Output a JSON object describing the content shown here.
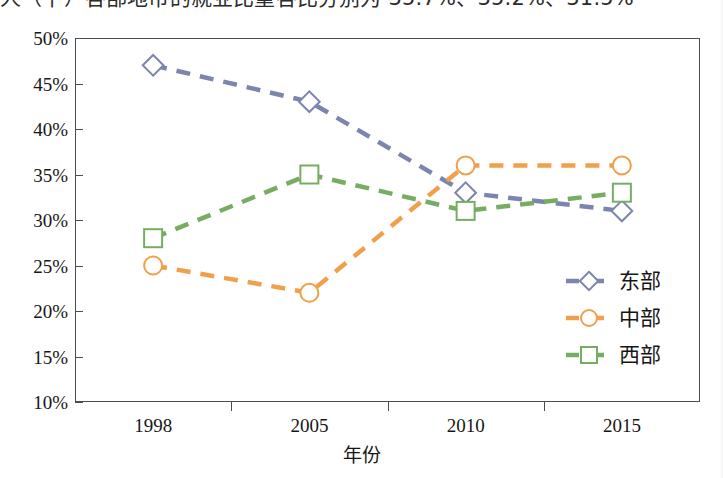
{
  "page": {
    "clipped_title": "人（下）各部地市的就业比重各比分别为 35.7%、35.2%、31.5%"
  },
  "chart_data": {
    "type": "line",
    "title": "",
    "xlabel": "年份",
    "ylabel": "",
    "categories": [
      "1998",
      "2005",
      "2010",
      "2015"
    ],
    "ylim": [
      10,
      50
    ],
    "ytick_labels": [
      "50%",
      "45%",
      "40%",
      "35%",
      "30%",
      "25%",
      "20%",
      "15%",
      "10%"
    ],
    "ytick_values": [
      50,
      45,
      40,
      35,
      30,
      25,
      20,
      15,
      10
    ],
    "grid": false,
    "legend_position": "right-inside",
    "line_style": "dashed",
    "series": [
      {
        "name": "东部",
        "color": "#7b85ae",
        "marker": "diamond",
        "values": [
          47,
          43,
          33,
          31
        ]
      },
      {
        "name": "中部",
        "color": "#f0a04b",
        "marker": "circle",
        "values": [
          25,
          22,
          36,
          36
        ]
      },
      {
        "name": "西部",
        "color": "#77ad63",
        "marker": "square",
        "values": [
          28,
          35,
          31,
          33
        ]
      }
    ]
  },
  "axis": {
    "x_title": "年份"
  }
}
